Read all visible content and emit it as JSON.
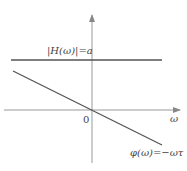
{
  "diagram": {
    "title": "",
    "labels": {
      "magnitude": "|H(ω)|=a",
      "phase": "φ(ω)=−ωτ",
      "x_axis": "ω",
      "origin": "0"
    },
    "colors": {
      "line": "#555555",
      "axis": "#888888",
      "text": "#444444"
    }
  }
}
